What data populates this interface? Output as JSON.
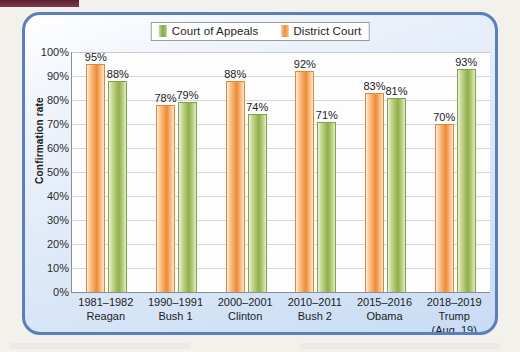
{
  "figure": {
    "frame_border_color": "#5a7fc0",
    "page_background": "#f3f1ec",
    "top_marker_color": "#5c2030"
  },
  "legend": {
    "position": "top-center",
    "entries": [
      {
        "label": "Court of Appeals",
        "color": "#8fae4b",
        "icon": "legend-swatch-green"
      },
      {
        "label": "District Court",
        "color": "#ef8a33",
        "icon": "legend-swatch-orange"
      }
    ]
  },
  "axes": {
    "y_title": "Confirmation rate",
    "y_ticks": [
      "100%",
      "90%",
      "80%",
      "70%",
      "60%",
      "50%",
      "40%",
      "30%",
      "20%",
      "10%",
      "0%"
    ],
    "y_min": 0,
    "y_max": 100,
    "grid": true
  },
  "categories": [
    {
      "period": "1981–1982",
      "name": "Reagan",
      "note": ""
    },
    {
      "period": "1990–1991",
      "name": "Bush 1",
      "note": ""
    },
    {
      "period": "2000–2001",
      "name": "Clinton",
      "note": ""
    },
    {
      "period": "2010–2011",
      "name": "Bush 2",
      "note": ""
    },
    {
      "period": "2015–2016",
      "name": "Obama",
      "note": ""
    },
    {
      "period": "2018–2019",
      "name": "Trump",
      "note": "(Aug. 19)"
    }
  ],
  "bars": [
    {
      "group": 0,
      "series": "District Court",
      "value": 95,
      "label": "95%"
    },
    {
      "group": 0,
      "series": "Court of Appeals",
      "value": 88,
      "label": "88%"
    },
    {
      "group": 1,
      "series": "District Court",
      "value": 78,
      "label": "78%"
    },
    {
      "group": 1,
      "series": "Court of Appeals",
      "value": 79,
      "label": "79%"
    },
    {
      "group": 2,
      "series": "District Court",
      "value": 88,
      "label": "88%"
    },
    {
      "group": 2,
      "series": "Court of Appeals",
      "value": 74,
      "label": "74%"
    },
    {
      "group": 3,
      "series": "District Court",
      "value": 92,
      "label": "92%"
    },
    {
      "group": 3,
      "series": "Court of Appeals",
      "value": 71,
      "label": "71%"
    },
    {
      "group": 4,
      "series": "District Court",
      "value": 83,
      "label": "83%"
    },
    {
      "group": 4,
      "series": "Court of Appeals",
      "value": 81,
      "label": "81%"
    },
    {
      "group": 5,
      "series": "District Court",
      "value": 70,
      "label": "70%"
    },
    {
      "group": 5,
      "series": "Court of Appeals",
      "value": 93,
      "label": "93%"
    }
  ],
  "chart_data": {
    "type": "bar",
    "title": "",
    "subtitle": "",
    "xlabel": "",
    "ylabel": "Confirmation rate",
    "ylim": [
      0,
      100
    ],
    "grid": true,
    "legend_position": "top-center",
    "categories": [
      "1981–1982 Reagan",
      "1990–1991 Bush 1",
      "2000–2001 Clinton",
      "2010–2011 Bush 2",
      "2015–2016 Obama",
      "2018–2019 Trump (Aug. 19)"
    ],
    "series": [
      {
        "name": "District Court",
        "color": "#ef8a33",
        "values": [
          95,
          78,
          88,
          92,
          83,
          70
        ],
        "data_labels": [
          "95%",
          "78%",
          "88%",
          "92%",
          "83%",
          "70%"
        ]
      },
      {
        "name": "Court of Appeals",
        "color": "#8fae4b",
        "values": [
          88,
          79,
          74,
          71,
          81,
          93
        ],
        "data_labels": [
          "88%",
          "79%",
          "74%",
          "71%",
          "81%",
          "93%"
        ]
      }
    ],
    "ytick_labels": [
      "0%",
      "10%",
      "20%",
      "30%",
      "40%",
      "50%",
      "60%",
      "70%",
      "80%",
      "90%",
      "100%"
    ],
    "annotations": []
  }
}
